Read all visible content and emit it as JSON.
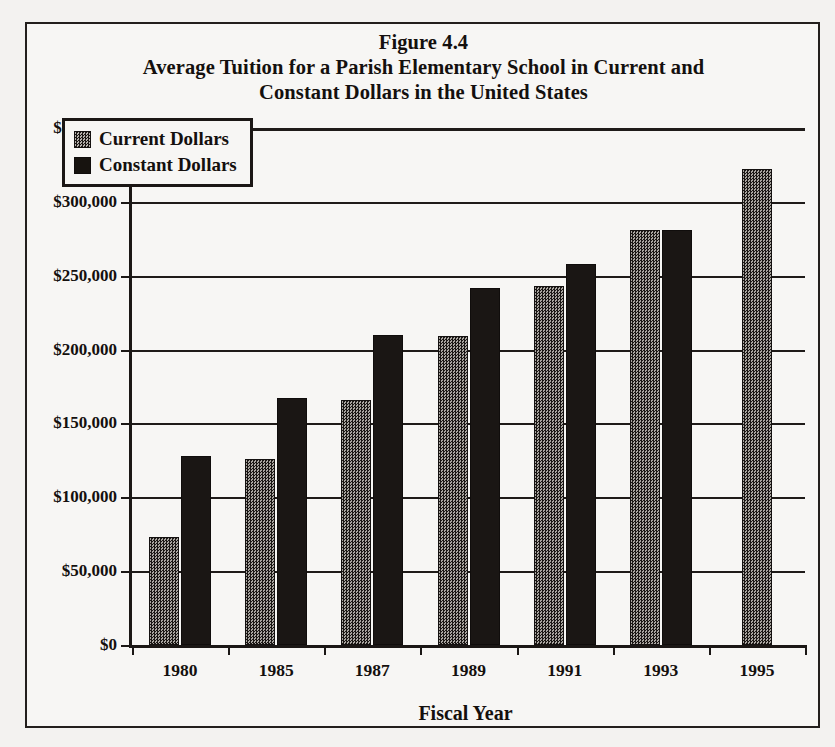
{
  "figure": {
    "title_lines": [
      "Figure 4.4",
      "Average Tuition for a Parish Elementary School in Current and",
      "Constant Dollars in the United States"
    ]
  },
  "legend": {
    "position": "inside-top-left",
    "entries": [
      {
        "label": "Current Dollars",
        "swatch": "hatched-checker-swatch"
      },
      {
        "label": "Constant Dollars",
        "swatch": "solid-black-swatch"
      }
    ]
  },
  "axes": {
    "x_title": "Fiscal Year",
    "y_tick_labels": [
      "$0",
      "$50,000",
      "$100,000",
      "$150,000",
      "$200,000",
      "$250,000",
      "$300,000",
      "$350,000"
    ],
    "x_tick_labels": [
      "1980",
      "1985",
      "1987",
      "1989",
      "1991",
      "1993",
      "1995"
    ]
  },
  "chart_data": {
    "type": "bar",
    "xlabel": "Fiscal Year",
    "ylabel": "",
    "categories": [
      "1980",
      "1985",
      "1987",
      "1989",
      "1991",
      "1993",
      "1995"
    ],
    "series": [
      {
        "name": "Current Dollars",
        "values": [
          73000,
          126000,
          166000,
          209000,
          243000,
          281000,
          322000
        ]
      },
      {
        "name": "Constant Dollars",
        "values": [
          128000,
          167000,
          210000,
          242000,
          258000,
          281000,
          null
        ]
      }
    ],
    "ylim": [
      0,
      350000
    ],
    "ytick_values": [
      0,
      50000,
      100000,
      150000,
      200000,
      250000,
      300000,
      350000
    ],
    "grid": true,
    "legend_position": "upper left"
  }
}
